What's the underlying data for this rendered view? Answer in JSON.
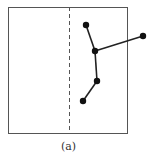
{
  "figure": {
    "caption": "(a)",
    "frame": {
      "x": 8,
      "y": 7,
      "width": 119,
      "height": 126,
      "stroke": "#555555"
    },
    "divider": {
      "x": 69,
      "y1": 7,
      "y2": 133,
      "style": "dashed",
      "stroke": "#555555"
    },
    "graph": {
      "node_color": "#111111",
      "edge_color": "#222222",
      "nodes": [
        {
          "id": "n1",
          "x": 86,
          "y": 25
        },
        {
          "id": "n2",
          "x": 95,
          "y": 51
        },
        {
          "id": "n3",
          "x": 143,
          "y": 36
        },
        {
          "id": "n4",
          "x": 97,
          "y": 81
        },
        {
          "id": "n5",
          "x": 83,
          "y": 101
        }
      ],
      "edges": [
        [
          "n1",
          "n2"
        ],
        [
          "n2",
          "n3"
        ],
        [
          "n2",
          "n4"
        ],
        [
          "n4",
          "n5"
        ]
      ]
    }
  }
}
